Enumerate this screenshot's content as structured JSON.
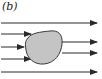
{
  "figure": {
    "label": "(b)",
    "colors": {
      "line": "#2a2a2a",
      "obstacle_fill": "#c4c4c4",
      "obstacle_stroke": "#3a3a3a",
      "background": "#ffffff"
    },
    "arrows": [
      {
        "id": "top",
        "x1": 1,
        "y1": 23,
        "x2": 97,
        "y2": 23
      },
      {
        "id": "in-1",
        "x1": 1,
        "y1": 34,
        "x2": 31,
        "y2": 34
      },
      {
        "id": "in-2",
        "x1": 1,
        "y1": 47,
        "x2": 24,
        "y2": 47
      },
      {
        "id": "in-3",
        "x1": 1,
        "y1": 59,
        "x2": 31,
        "y2": 59
      },
      {
        "id": "out-1",
        "x1": 62,
        "y1": 42,
        "x2": 97,
        "y2": 42
      },
      {
        "id": "out-2",
        "x1": 62,
        "y1": 53,
        "x2": 97,
        "y2": 53
      },
      {
        "id": "bottom",
        "x1": 1,
        "y1": 72,
        "x2": 97,
        "y2": 72
      }
    ],
    "obstacle": {
      "path": "M28,38 C31,33 40,32 50,31 C58,30 63,34 62,44 C61,54 55,63 44,64 C34,65 27,58 26,50 C25,44 25,41 28,38 Z"
    }
  }
}
